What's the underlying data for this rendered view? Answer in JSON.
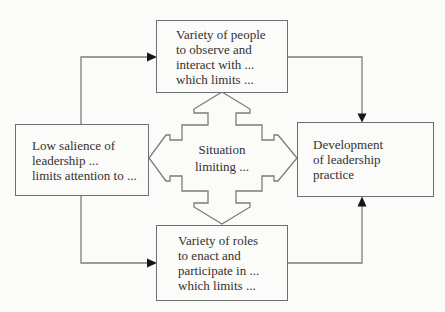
{
  "diagram": {
    "boxes": {
      "top": {
        "lines": [
          "Variety of people",
          "to observe and",
          "interact with ...",
          "which limits ..."
        ]
      },
      "left": {
        "lines": [
          "Low salience of",
          "leadership ...",
          "limits attention to ..."
        ]
      },
      "right": {
        "lines": [
          "Development",
          "of leadership",
          "practice"
        ]
      },
      "bottom": {
        "lines": [
          "Variety of roles",
          "to enact and",
          "participate in ...",
          "which limits ..."
        ]
      },
      "center": {
        "lines": [
          "Situation",
          "limiting ..."
        ]
      }
    },
    "colors": {
      "background": "#fbfbf9",
      "box_border": "#6e6e6e",
      "line": "#7c7c7a",
      "arrowhead": "#161616",
      "text": "#323230"
    }
  }
}
